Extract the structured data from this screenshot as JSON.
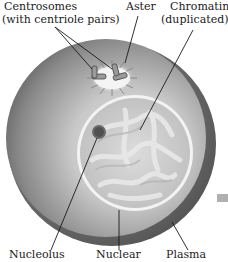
{
  "diagram": {
    "type": "cell-illustration",
    "labels": {
      "centrosomes_line1": "Centrosomes",
      "centrosomes_line2": "(with centriole pairs)",
      "aster": "Aster",
      "chromatin_line1": "Chromatin",
      "chromatin_line2": "(duplicated)",
      "nucleolus": "Nucleolus",
      "nuclear": "Nuclear",
      "plasma": "Plasma"
    },
    "colors": {
      "cytoplasm_dark": "#6e6e6e",
      "cytoplasm_light": "#d8d8d8",
      "nucleus_fill": "#cfcfcf",
      "nuclear_envelope": "#f2f2f2",
      "nucleolus": "#555555",
      "leader_line": "#1a1a1a",
      "marker_square": "#b0b0b0"
    }
  }
}
